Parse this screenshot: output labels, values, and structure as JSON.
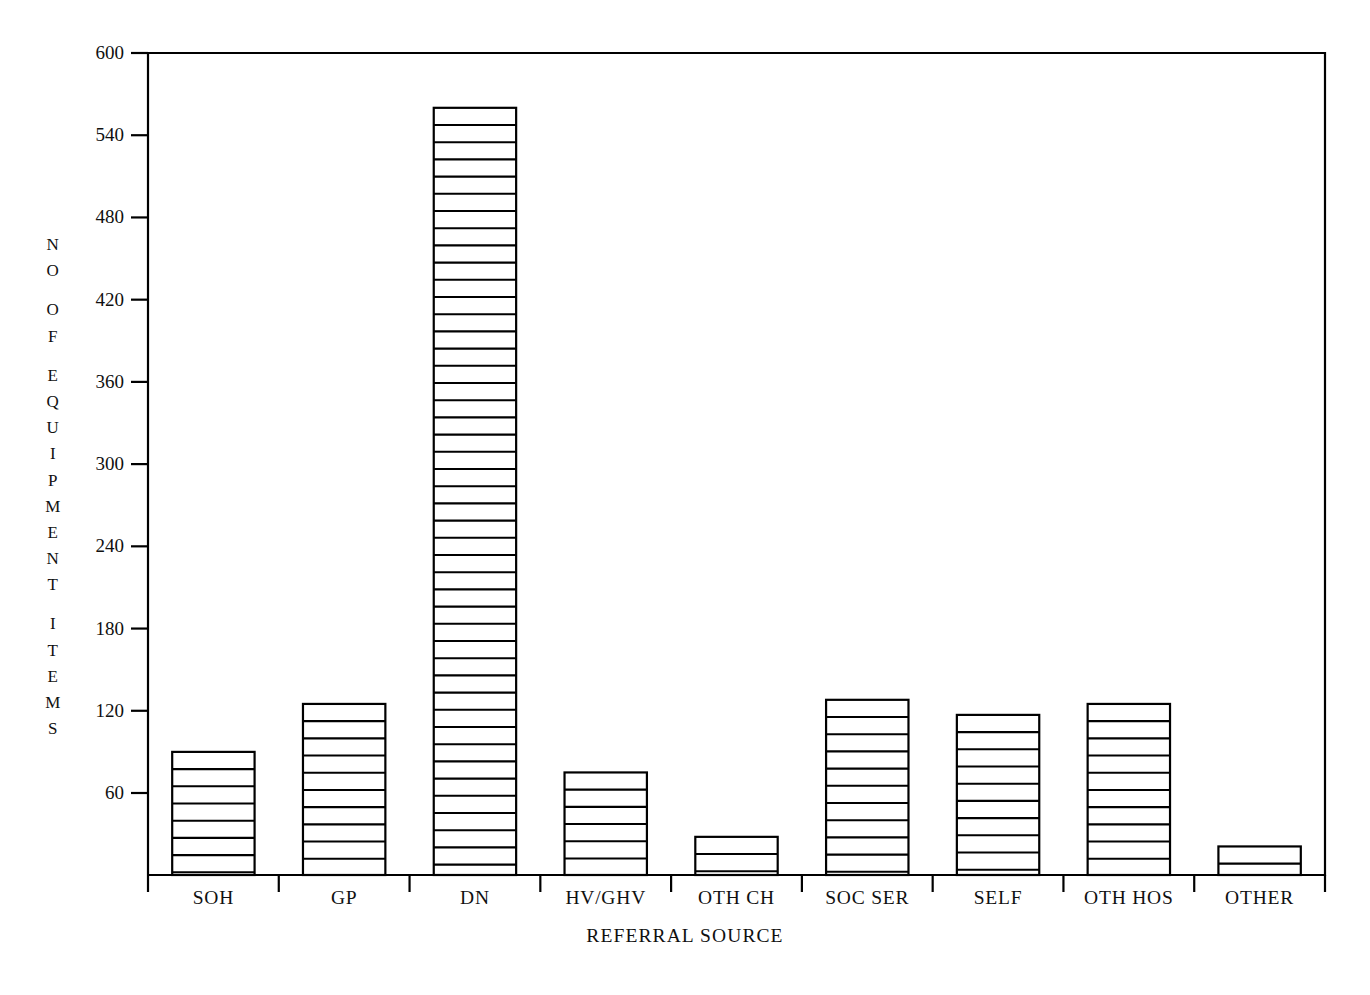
{
  "chart_data": {
    "type": "bar",
    "title": "",
    "xlabel": "REFERRAL SOURCE",
    "ylabel": "NO OF EQUIPMENT ITEMS",
    "ylabel_stacked": [
      "N",
      "O",
      "",
      "O",
      "F",
      "",
      "E",
      "Q",
      "U",
      "I",
      "P",
      "M",
      "E",
      "N",
      "T",
      "",
      "I",
      "T",
      "E",
      "M",
      "S"
    ],
    "categories": [
      "SOH",
      "GP",
      "DN",
      "HV/GHV",
      "OTH  CH",
      "SOC  SER",
      "SELF",
      "OTH HOS",
      "OTHER"
    ],
    "values": [
      90,
      125,
      560,
      75,
      28,
      128,
      117,
      125,
      21
    ],
    "yticks": [
      60,
      120,
      180,
      240,
      300,
      360,
      420,
      480,
      540,
      600
    ],
    "ytick_labels": [
      "60",
      "120",
      "180",
      "240",
      "300",
      "360",
      "420",
      "480",
      "540",
      "600"
    ],
    "ylim": [
      0,
      610
    ],
    "grid": false,
    "legend": null,
    "bar_fill": "#ffffff",
    "bar_edge": "#000000",
    "hatch": "horizontal-lines",
    "axis_color": "#000000",
    "background": "#ffffff"
  },
  "figure": {
    "frame_visible": true,
    "plot_left_px": 148,
    "plot_right_px": 1325,
    "plot_top_px": 53,
    "plot_bottom_px": 875
  }
}
